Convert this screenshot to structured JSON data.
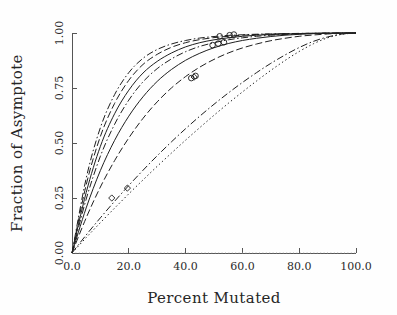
{
  "chart_data": {
    "type": "line",
    "title": "",
    "xlabel": "Percent Mutated",
    "ylabel": "Fraction of Asymptote",
    "xlim": [
      0.0,
      100.0
    ],
    "ylim": [
      0.0,
      1.0
    ],
    "xticks": [
      0.0,
      20.0,
      40.0,
      60.0,
      80.0,
      100.0
    ],
    "yticks": [
      0.0,
      0.25,
      0.5,
      0.75,
      1.0
    ],
    "xtick_labels": [
      "0.0",
      "20.0",
      "40.0",
      "60.0",
      "80.0",
      "100.0"
    ],
    "ytick_labels": [
      "0.00",
      "0.25",
      "0.50",
      "0.75",
      "1.00"
    ],
    "grid": false,
    "legend": "none",
    "x": [
      0,
      5,
      10,
      15,
      20,
      25,
      30,
      35,
      40,
      45,
      50,
      55,
      60,
      65,
      70,
      75,
      80,
      85,
      90,
      95,
      100
    ],
    "series": [
      {
        "name": "curve-1",
        "style": "dash-dot",
        "values": [
          0.0,
          0.34,
          0.57,
          0.72,
          0.82,
          0.885,
          0.925,
          0.95,
          0.966,
          0.977,
          0.984,
          0.989,
          0.992,
          0.9945,
          0.996,
          0.9972,
          0.9981,
          0.9988,
          0.9993,
          0.9997,
          1.0
        ]
      },
      {
        "name": "curve-2",
        "style": "dashed",
        "values": [
          0.0,
          0.31,
          0.53,
          0.68,
          0.785,
          0.857,
          0.903,
          0.935,
          0.956,
          0.97,
          0.979,
          0.985,
          0.99,
          0.993,
          0.9952,
          0.9968,
          0.998,
          0.9988,
          0.9994,
          0.9998,
          1.0
        ]
      },
      {
        "name": "curve-3",
        "style": "solid",
        "values": [
          0.0,
          0.275,
          0.485,
          0.633,
          0.74,
          0.818,
          0.871,
          0.909,
          0.937,
          0.956,
          0.969,
          0.978,
          0.985,
          0.99,
          0.993,
          0.9955,
          0.9972,
          0.9984,
          0.9992,
          0.9997,
          1.0
        ]
      },
      {
        "name": "curve-4",
        "style": "dash-dot",
        "values": [
          0.0,
          0.245,
          0.44,
          0.585,
          0.695,
          0.778,
          0.838,
          0.882,
          0.915,
          0.939,
          0.956,
          0.969,
          0.978,
          0.985,
          0.99,
          0.9935,
          0.996,
          0.9977,
          0.9989,
          0.9996,
          1.0
        ]
      },
      {
        "name": "curve-5",
        "style": "solid",
        "values": [
          0.0,
          0.205,
          0.375,
          0.512,
          0.622,
          0.71,
          0.78,
          0.834,
          0.876,
          0.908,
          0.933,
          0.952,
          0.966,
          0.976,
          0.984,
          0.99,
          0.9941,
          0.997,
          0.9987,
          0.9996,
          1.0
        ]
      },
      {
        "name": "curve-6",
        "style": "dashed",
        "values": [
          0.0,
          0.16,
          0.3,
          0.42,
          0.523,
          0.612,
          0.687,
          0.75,
          0.802,
          0.845,
          0.88,
          0.909,
          0.932,
          0.95,
          0.965,
          0.976,
          0.985,
          0.991,
          0.9955,
          0.9988,
          1.0
        ]
      },
      {
        "name": "curve-7",
        "style": "dash-dot",
        "values": [
          0.0,
          0.082,
          0.16,
          0.235,
          0.307,
          0.376,
          0.442,
          0.505,
          0.565,
          0.622,
          0.676,
          0.727,
          0.775,
          0.82,
          0.862,
          0.9,
          0.934,
          0.962,
          0.982,
          0.995,
          1.0
        ]
      },
      {
        "name": "curve-8",
        "style": "dotted",
        "values": [
          0.0,
          0.07,
          0.138,
          0.204,
          0.269,
          0.332,
          0.394,
          0.454,
          0.513,
          0.57,
          0.626,
          0.68,
          0.732,
          0.782,
          0.83,
          0.875,
          0.916,
          0.951,
          0.978,
          0.994,
          1.0
        ]
      }
    ],
    "markers": [
      {
        "name": "marker-low-a",
        "shape": "diamond",
        "x": 14.0,
        "y": 0.25
      },
      {
        "name": "marker-low-b",
        "shape": "diamond",
        "x": 19.5,
        "y": 0.295
      },
      {
        "name": "marker-mid-a",
        "shape": "circle",
        "x": 42.0,
        "y": 0.795
      },
      {
        "name": "marker-mid-b",
        "shape": "circle",
        "x": 43.5,
        "y": 0.805
      },
      {
        "name": "marker-mid-c",
        "shape": "diamond",
        "x": 43.0,
        "y": 0.8
      },
      {
        "name": "marker-high-a",
        "shape": "circle",
        "x": 49.5,
        "y": 0.945
      },
      {
        "name": "marker-high-b",
        "shape": "circle",
        "x": 51.5,
        "y": 0.952
      },
      {
        "name": "marker-high-c",
        "shape": "circle",
        "x": 53.5,
        "y": 0.958
      },
      {
        "name": "marker-high-d",
        "shape": "circle",
        "x": 52.0,
        "y": 0.985
      },
      {
        "name": "marker-high-e",
        "shape": "circle",
        "x": 55.5,
        "y": 0.99
      },
      {
        "name": "marker-high-f",
        "shape": "circle",
        "x": 57.0,
        "y": 0.993
      }
    ],
    "baseline": {
      "name": "zero-baseline",
      "y": 0.0,
      "style": "dotted"
    },
    "colors": {
      "line": "#1f1f1f",
      "axis": "#555555",
      "text": "#262626",
      "background": "#fefefe"
    }
  }
}
